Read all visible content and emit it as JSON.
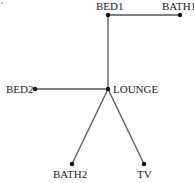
{
  "diagram": {
    "type": "tree",
    "nodes": [
      {
        "id": "BED1",
        "label": "BED1",
        "x": 108,
        "y": 15,
        "label_x": 96,
        "label_y": 10
      },
      {
        "id": "BATH1",
        "label": "BATH1",
        "x": 180,
        "y": 15,
        "label_x": 162,
        "label_y": 10
      },
      {
        "id": "LOUNGE",
        "label": "LOUNGE",
        "x": 108,
        "y": 89,
        "label_x": 113,
        "label_y": 93
      },
      {
        "id": "BED2",
        "label": "BED2",
        "x": 35,
        "y": 89,
        "label_x": 6,
        "label_y": 93
      },
      {
        "id": "BATH2",
        "label": "BATH2",
        "x": 72,
        "y": 164,
        "label_x": 53,
        "label_y": 178
      },
      {
        "id": "TV",
        "label": "TV",
        "x": 144,
        "y": 164,
        "label_x": 137,
        "label_y": 178
      }
    ],
    "edges": [
      {
        "from": "BED1",
        "to": "BATH1"
      },
      {
        "from": "BED1",
        "to": "LOUNGE"
      },
      {
        "from": "BED2",
        "to": "LOUNGE"
      },
      {
        "from": "LOUNGE",
        "to": "BATH2"
      },
      {
        "from": "LOUNGE",
        "to": "TV"
      }
    ],
    "colors": {
      "edge": "#555555",
      "node": "#111111",
      "label": "#222222",
      "background": "#ffffff"
    }
  }
}
